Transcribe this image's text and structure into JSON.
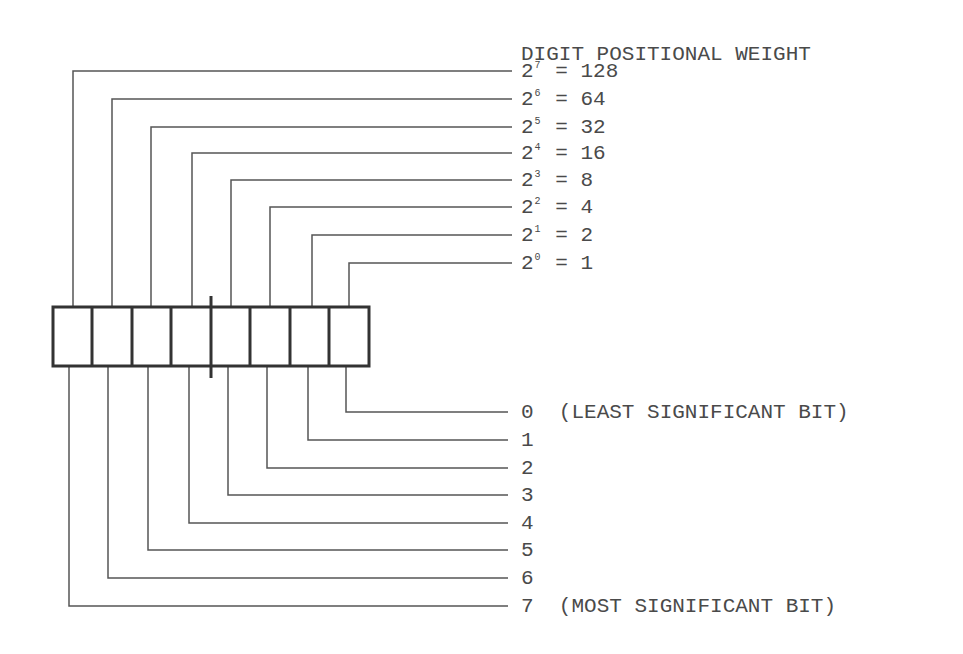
{
  "diagram": {
    "header": "DIGIT POSITIONAL WEIGHT",
    "weights": [
      {
        "base": "2",
        "exp": "7",
        "eq": "= 128"
      },
      {
        "base": "2",
        "exp": "6",
        "eq": "= 64"
      },
      {
        "base": "2",
        "exp": "5",
        "eq": "= 32"
      },
      {
        "base": "2",
        "exp": "4",
        "eq": "= 16"
      },
      {
        "base": "2",
        "exp": "3",
        "eq": "= 8"
      },
      {
        "base": "2",
        "exp": "2",
        "eq": "= 4"
      },
      {
        "base": "2",
        "exp": "1",
        "eq": "= 2"
      },
      {
        "base": "2",
        "exp": "0",
        "eq": "= 1"
      }
    ],
    "bits": [
      {
        "index": "0",
        "note": "(LEAST SIGNIFICANT BIT)"
      },
      {
        "index": "1",
        "note": ""
      },
      {
        "index": "2",
        "note": ""
      },
      {
        "index": "3",
        "note": ""
      },
      {
        "index": "4",
        "note": ""
      },
      {
        "index": "5",
        "note": ""
      },
      {
        "index": "6",
        "note": ""
      },
      {
        "index": "7",
        "note": "(MOST SIGNIFICANT BIT)"
      }
    ],
    "register_cells": 8,
    "colors": {
      "line": "#555555",
      "box": "#333333",
      "text": "#4a4a4a"
    }
  }
}
